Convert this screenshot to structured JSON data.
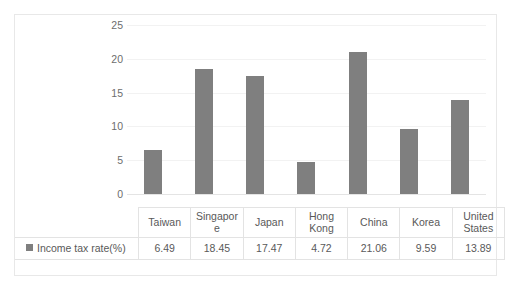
{
  "chart_data": {
    "type": "bar",
    "title": "",
    "xlabel": "",
    "ylabel": "",
    "categories": [
      "Taiwan",
      "Singapore",
      "Japan",
      "Hong Kong",
      "China",
      "Korea",
      "United States"
    ],
    "category_lines": [
      [
        "Taiwan"
      ],
      [
        "Singapor",
        "e"
      ],
      [
        "Japan"
      ],
      [
        "Hong",
        "Kong"
      ],
      [
        "China"
      ],
      [
        "Korea"
      ],
      [
        "United",
        "States"
      ]
    ],
    "series": [
      {
        "name": "Income tax rate(%)",
        "values": [
          6.49,
          18.45,
          17.47,
          4.72,
          21.06,
          9.59,
          13.89
        ],
        "value_labels": [
          "6.49",
          "18.45",
          "17.47",
          "4.72",
          "21.06",
          "9.59",
          "13.89"
        ],
        "color": "#7f7f7f"
      }
    ],
    "ylim": [
      0,
      25
    ],
    "yticks": [
      0,
      5,
      10,
      15,
      20,
      25
    ],
    "ytick_labels": [
      "0",
      "5",
      "10",
      "15",
      "20",
      "25"
    ],
    "grid": true,
    "legend_position": "data-table-left",
    "has_data_table": true
  },
  "legend": {
    "series_label": "Income tax rate(%)",
    "swatch_color": "#7f7f7f"
  },
  "colors": {
    "bar": "#7f7f7f",
    "text": "#595959",
    "axis_text": "#6d6d6d",
    "gridline": "#f2f2f2",
    "table_border": "#e3e3e3",
    "frame_border": "#e8e8e8",
    "background": "#ffffff"
  }
}
